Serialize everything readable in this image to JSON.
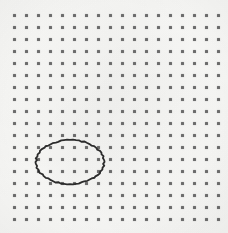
{
  "scene": {
    "title": "Dot grid with hand-drawn ellipse annotation",
    "background_color": "#f7f7f5",
    "width": 228,
    "height": 233
  },
  "grid": {
    "name": "dot-grid",
    "columns": 18,
    "rows": 18,
    "origin_x": 14,
    "origin_y": 15,
    "spacing_x": 12,
    "spacing_y": 12,
    "dot_size": 3,
    "dot_color": "#6c6c6c",
    "dot_shape": "square"
  },
  "annotations": [
    {
      "name": "ellipse-selection",
      "type": "ellipse",
      "center_x": 70,
      "center_y": 162,
      "radius_x": 34,
      "radius_y": 22,
      "stroke_color": "#2b2b2b",
      "stroke_width": 1.8,
      "style": "hand-drawn",
      "encircled_columns": 5,
      "encircled_rows": 4,
      "encircled_dot_count": 20
    }
  ],
  "chart_data": {
    "type": "scatter",
    "xlabel": "",
    "ylabel": "",
    "grid": true,
    "legend": "none",
    "xlim": [
      0,
      228
    ],
    "ylim": [
      0,
      233
    ],
    "series": [
      {
        "name": "grid-dots",
        "marker": "square",
        "color": "#6c6c6c",
        "count": 324,
        "columns": 18,
        "rows": 18,
        "x_start": 14,
        "y_start": 15,
        "x_step": 12,
        "y_step": 12
      }
    ],
    "annotations": [
      {
        "name": "ellipse-selection",
        "shape": "ellipse",
        "cx": 70,
        "cy": 162,
        "rx": 34,
        "ry": 22,
        "stroke": "#2b2b2b",
        "fill": "none"
      }
    ]
  }
}
